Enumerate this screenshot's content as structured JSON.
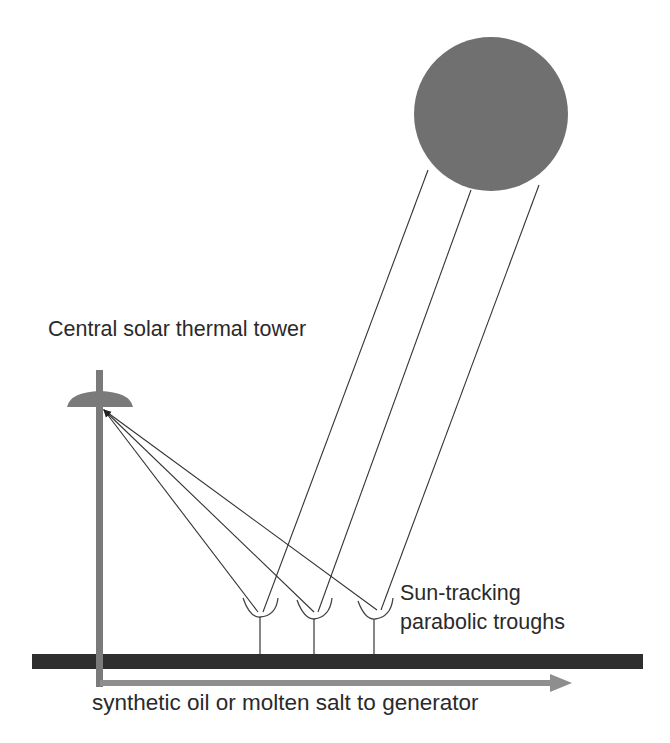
{
  "diagram": {
    "labels": {
      "tower": "Central solar thermal tower",
      "troughs_line1": "Sun-tracking",
      "troughs_line2": "parabolic troughs",
      "flow": "synthetic oil or molten salt to generator"
    },
    "colors": {
      "sun": "#707070",
      "tower": "#7a7a7a",
      "ground": "#2e2e2e",
      "rays": "#333333",
      "flow_arrow": "#8e8e8e",
      "text": "#2a2a2a"
    },
    "nodes": [
      {
        "id": "sun",
        "shape": "circle",
        "cx": 491,
        "cy": 114,
        "r": 77
      },
      {
        "id": "tower",
        "shape": "pole-with-dish-receiver",
        "x": 100,
        "top": 370,
        "bottom": 686,
        "receiver_y": 405
      },
      {
        "id": "trough-1",
        "shape": "parabolic-trough",
        "x": 258,
        "y": 613
      },
      {
        "id": "trough-2",
        "shape": "parabolic-trough",
        "x": 314,
        "y": 613
      },
      {
        "id": "trough-3",
        "shape": "parabolic-trough",
        "x": 377,
        "y": 613
      },
      {
        "id": "ground",
        "shape": "bar",
        "x1": 32,
        "x2": 643,
        "y": 661
      },
      {
        "id": "flow-arrow",
        "shape": "arrow",
        "x1": 100,
        "x2": 572,
        "y": 683
      }
    ],
    "edges": [
      {
        "from": "sun",
        "to": "trough-1",
        "kind": "incoming-ray"
      },
      {
        "from": "sun",
        "to": "trough-2",
        "kind": "incoming-ray"
      },
      {
        "from": "sun",
        "to": "trough-3",
        "kind": "incoming-ray"
      },
      {
        "from": "trough-1",
        "to": "tower",
        "kind": "reflected-ray"
      },
      {
        "from": "trough-2",
        "to": "tower",
        "kind": "reflected-ray"
      },
      {
        "from": "trough-3",
        "to": "tower",
        "kind": "reflected-ray"
      },
      {
        "from": "tower",
        "to": "generator",
        "kind": "fluid-flow"
      }
    ]
  }
}
